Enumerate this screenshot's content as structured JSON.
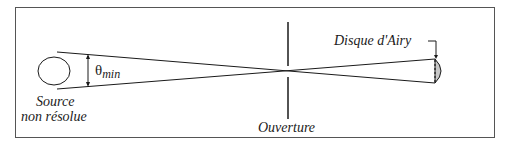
{
  "diagram": {
    "type": "optics-resolution",
    "labels": {
      "source_line1": "Source",
      "source_line2": "non résolue",
      "theta": "θ",
      "theta_sub": "min",
      "aperture": "Ouverture",
      "airy_disk": "Disque d'Airy"
    },
    "colors": {
      "stroke": "#1a1a1a",
      "frame": "#555555",
      "airy_fill": "#c8c8c8"
    }
  }
}
